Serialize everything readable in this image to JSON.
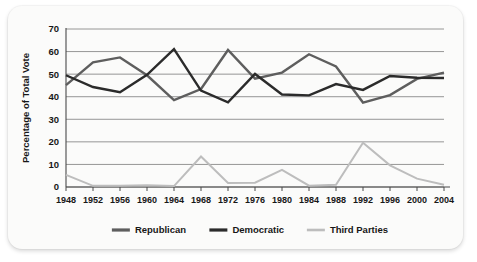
{
  "chart_data": {
    "type": "line",
    "title": "",
    "xlabel": "",
    "ylabel": "Percentage of Total Vote",
    "x": [
      1948,
      1952,
      1956,
      1960,
      1964,
      1968,
      1972,
      1976,
      1980,
      1984,
      1988,
      1992,
      1996,
      2000,
      2004
    ],
    "categories": [
      "1948",
      "1952",
      "1956",
      "1960",
      "1964",
      "1968",
      "1972",
      "1976",
      "1980",
      "1984",
      "1988",
      "1992",
      "1996",
      "2000",
      "2004"
    ],
    "xlim": [
      1948,
      2004
    ],
    "ylim": [
      0,
      70
    ],
    "yticks": [
      0,
      10,
      20,
      30,
      40,
      50,
      60,
      70
    ],
    "ytick_labels": [
      "0",
      "10",
      "20",
      "30",
      "40",
      "50",
      "60",
      "70"
    ],
    "grid": true,
    "grid_axis": "y",
    "legend_position": "bottom",
    "series": [
      {
        "name": "Republican",
        "color": "#5e5e5e",
        "values": [
          45.1,
          55.2,
          57.4,
          49.5,
          38.5,
          43.4,
          60.7,
          48.0,
          50.7,
          58.8,
          53.4,
          37.4,
          40.7,
          47.9,
          50.7
        ]
      },
      {
        "name": "Democratic",
        "color": "#2b2b2b",
        "values": [
          49.5,
          44.3,
          42.0,
          49.7,
          61.1,
          42.7,
          37.5,
          50.1,
          41.0,
          40.6,
          45.6,
          43.0,
          49.2,
          48.4,
          48.3
        ]
      },
      {
        "name": "Third Parties",
        "color": "#bdbdbd",
        "values": [
          5.4,
          0.5,
          0.6,
          0.8,
          0.4,
          13.5,
          1.8,
          1.9,
          7.6,
          0.6,
          1.0,
          19.6,
          9.6,
          3.7,
          1.0
        ]
      }
    ],
    "legend": [
      {
        "label": "Republican",
        "color": "#5e5e5e"
      },
      {
        "label": "Democratic",
        "color": "#2b2b2b"
      },
      {
        "label": "Third Parties",
        "color": "#bdbdbd"
      }
    ],
    "colors": {
      "gridline": "#8a8a8a",
      "axis": "#4a4a4a",
      "text": "#171717",
      "plot_background": "#fbfbfa",
      "card_background": "#fbfbfa"
    }
  }
}
